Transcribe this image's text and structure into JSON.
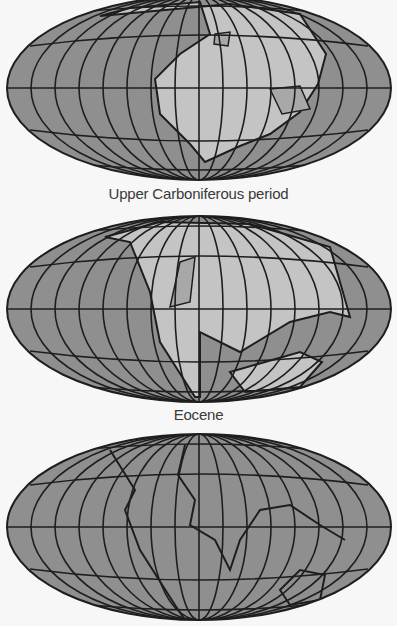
{
  "figure": {
    "projection": "Mollweide-style world map",
    "colors": {
      "ocean": "#8f8f8f",
      "land": "#c4c4c4",
      "shelf": "#a8a8a8",
      "lines": "#1e1e1e",
      "background": "#f7f7f7"
    },
    "maps": [
      {
        "label": "Upper Carboniferous period",
        "land_shade": "light"
      },
      {
        "label": "Eocene",
        "land_shade": "light"
      },
      {
        "label": "",
        "label_truncated": true,
        "land_shade": "none"
      }
    ]
  }
}
